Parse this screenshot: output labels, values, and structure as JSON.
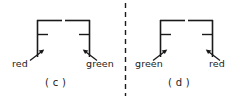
{
  "figure": {
    "type": "line-diagram",
    "stroke_color": "#1a1a1a",
    "background_color": "#ffffff",
    "divider": {
      "name": "dashed-divider",
      "orientation": "vertical",
      "x": 125,
      "y_start": 3,
      "y_end": 96,
      "dash": "5 4"
    },
    "panels": [
      {
        "id": "c",
        "caption": "( c )",
        "left_post_label": "red",
        "right_post_label": "green",
        "left_arrow": {
          "from_x": 30,
          "from_y": 61,
          "to_x": 44,
          "to_y": 50,
          "direction": "up-right"
        },
        "right_arrow": {
          "from_x": 97,
          "from_y": 61,
          "to_x": 83,
          "to_y": 50,
          "direction": "up-left"
        },
        "left_bracket": {
          "post_x": 37,
          "post_top": 20,
          "post_bottom": 57,
          "top_arm_x_end": 62,
          "top_arm_y": 20,
          "tick_x_end": 48,
          "tick_y": 34
        },
        "right_bracket": {
          "post_x": 90,
          "post_top": 20,
          "post_bottom": 57,
          "top_arm_x_end": 65,
          "top_arm_y": 20,
          "tick_x_end": 79,
          "tick_y": 34
        }
      },
      {
        "id": "d",
        "caption": "( d )",
        "left_post_label": "green",
        "right_post_label": "red",
        "left_arrow": {
          "from_x": 153,
          "from_y": 61,
          "to_x": 167,
          "to_y": 50,
          "direction": "up-right"
        },
        "right_arrow": {
          "from_x": 220,
          "from_y": 61,
          "to_x": 206,
          "to_y": 50,
          "direction": "up-left"
        },
        "left_bracket": {
          "post_x": 160,
          "post_top": 20,
          "post_bottom": 57,
          "top_arm_x_end": 185,
          "top_arm_y": 20,
          "tick_x_end": 171,
          "tick_y": 34
        },
        "right_bracket": {
          "post_x": 213,
          "post_top": 20,
          "post_bottom": 57,
          "top_arm_x_end": 188,
          "top_arm_y": 20,
          "tick_x_end": 202,
          "tick_y": 34
        }
      }
    ]
  }
}
